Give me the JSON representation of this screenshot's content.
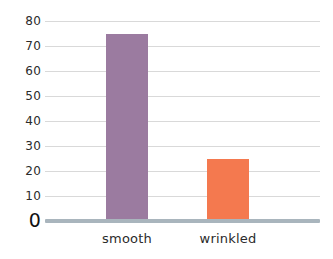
{
  "chart_data": {
    "type": "bar",
    "title": "",
    "xlabel": "",
    "ylabel": "",
    "categories": [
      "smooth",
      "wrinkled"
    ],
    "values": [
      75,
      25
    ],
    "series": [
      {
        "name": "count",
        "values": [
          75,
          25
        ]
      }
    ],
    "ylim": [
      0,
      80
    ],
    "yticks": [
      0,
      10,
      20,
      30,
      40,
      50,
      60,
      70,
      80
    ],
    "ytick_labels": [
      "0",
      "10",
      "20",
      "30",
      "40",
      "50",
      "60",
      "70",
      "80"
    ],
    "grid": true,
    "legend": false,
    "bar_colors": [
      "#9b7ba0",
      "#f4794f"
    ],
    "background_color": "#ffffff",
    "gridline_color": "#d9d9d9",
    "axis_color": "#a9b5bd",
    "tick_label_color": "#2b2b2b"
  }
}
